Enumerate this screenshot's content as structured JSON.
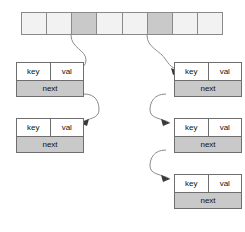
{
  "diagram": {
    "colors": {
      "cell_empty": "#f2f2f2",
      "cell_filled": "#c9c9c9",
      "node_border": "#6e6e6e",
      "node_body": "#ffffff",
      "node_next": "#c9c9c9",
      "arrow": "#8d8d8d",
      "arrowhead": "#3a3a3a",
      "background": "#ffffff"
    }
  },
  "bucket_array": {
    "count": 8,
    "cells": [
      {
        "index": 0,
        "filled": false
      },
      {
        "index": 1,
        "filled": false
      },
      {
        "index": 2,
        "filled": true
      },
      {
        "index": 3,
        "filled": false
      },
      {
        "index": 4,
        "filled": false
      },
      {
        "index": 5,
        "filled": true
      },
      {
        "index": 6,
        "filled": false
      },
      {
        "index": 7,
        "filled": false
      }
    ]
  },
  "node_labels": {
    "key": "key",
    "val": "val",
    "next": "next"
  },
  "chains": [
    {
      "name": "left-chain",
      "bucket_index": 2,
      "nodes": [
        {
          "id": "left-node-1",
          "key": "key",
          "val": "val",
          "next": "next"
        },
        {
          "id": "left-node-2",
          "key": "key",
          "val": "val",
          "next": "next"
        }
      ]
    },
    {
      "name": "right-chain",
      "bucket_index": 5,
      "nodes": [
        {
          "id": "right-node-1",
          "key": "key",
          "val": "val",
          "next": "next"
        },
        {
          "id": "right-node-2",
          "key": "key",
          "val": "val",
          "next": "next"
        },
        {
          "id": "right-node-3",
          "key": "key",
          "val": "val",
          "next": "next"
        }
      ]
    }
  ]
}
